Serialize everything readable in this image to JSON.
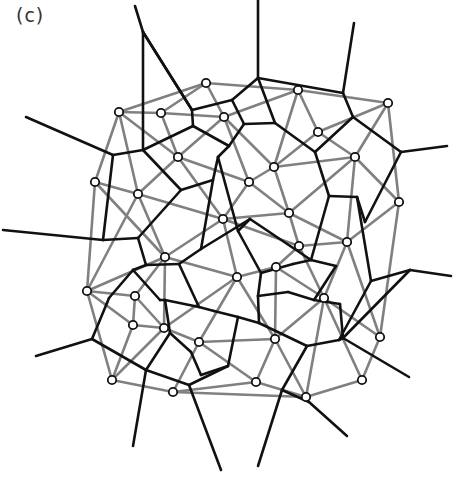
{
  "panel_label": "(c)",
  "colors": {
    "voronoi": "#111111",
    "delaunay": "#808080",
    "node_fill": "#ffffff",
    "node_stroke": "#111111"
  },
  "nodes": [
    [
      206,
      83
    ],
    [
      119,
      112
    ],
    [
      161,
      113
    ],
    [
      224,
      117
    ],
    [
      298,
      90
    ],
    [
      388,
      103
    ],
    [
      318,
      132
    ],
    [
      178,
      157
    ],
    [
      274,
      167
    ],
    [
      355,
      157
    ],
    [
      95,
      182
    ],
    [
      138,
      194
    ],
    [
      249,
      182
    ],
    [
      223,
      219
    ],
    [
      289,
      213
    ],
    [
      399,
      202
    ],
    [
      347,
      242
    ],
    [
      299,
      246
    ],
    [
      165,
      257
    ],
    [
      276,
      267
    ],
    [
      237,
      277
    ],
    [
      87,
      291
    ],
    [
      135,
      296
    ],
    [
      324,
      298
    ],
    [
      133,
      325
    ],
    [
      164,
      328
    ],
    [
      380,
      337
    ],
    [
      199,
      342
    ],
    [
      275,
      339
    ],
    [
      362,
      380
    ],
    [
      112,
      380
    ],
    [
      173,
      392
    ],
    [
      256,
      382
    ],
    [
      306,
      397
    ]
  ],
  "delaunay_edges": [
    [
      0,
      1
    ],
    [
      0,
      2
    ],
    [
      0,
      3
    ],
    [
      0,
      4
    ],
    [
      1,
      2
    ],
    [
      2,
      3
    ],
    [
      3,
      4
    ],
    [
      4,
      5
    ],
    [
      4,
      6
    ],
    [
      4,
      8
    ],
    [
      3,
      8
    ],
    [
      5,
      6
    ],
    [
      5,
      9
    ],
    [
      5,
      15
    ],
    [
      6,
      8
    ],
    [
      6,
      9
    ],
    [
      1,
      7
    ],
    [
      2,
      7
    ],
    [
      3,
      7
    ],
    [
      1,
      10
    ],
    [
      1,
      11
    ],
    [
      7,
      11
    ],
    [
      7,
      12
    ],
    [
      3,
      12
    ],
    [
      8,
      12
    ],
    [
      8,
      9
    ],
    [
      8,
      14
    ],
    [
      9,
      14
    ],
    [
      9,
      15
    ],
    [
      9,
      16
    ],
    [
      10,
      11
    ],
    [
      10,
      21
    ],
    [
      10,
      18
    ],
    [
      11,
      18
    ],
    [
      11,
      13
    ],
    [
      7,
      13
    ],
    [
      12,
      13
    ],
    [
      12,
      14
    ],
    [
      13,
      14
    ],
    [
      14,
      16
    ],
    [
      14,
      17
    ],
    [
      15,
      16
    ],
    [
      15,
      26
    ],
    [
      16,
      17
    ],
    [
      16,
      23
    ],
    [
      16,
      26
    ],
    [
      13,
      17
    ],
    [
      13,
      18
    ],
    [
      13,
      20
    ],
    [
      17,
      19
    ],
    [
      17,
      23
    ],
    [
      19,
      20
    ],
    [
      19,
      23
    ],
    [
      19,
      28
    ],
    [
      18,
      20
    ],
    [
      18,
      21
    ],
    [
      18,
      22
    ],
    [
      18,
      25
    ],
    [
      20,
      25
    ],
    [
      20,
      27
    ],
    [
      20,
      28
    ],
    [
      21,
      22
    ],
    [
      21,
      24
    ],
    [
      21,
      30
    ],
    [
      22,
      24
    ],
    [
      22,
      25
    ],
    [
      24,
      25
    ],
    [
      24,
      30
    ],
    [
      25,
      27
    ],
    [
      25,
      30
    ],
    [
      27,
      28
    ],
    [
      27,
      31
    ],
    [
      27,
      32
    ],
    [
      28,
      32
    ],
    [
      28,
      23
    ],
    [
      28,
      33
    ],
    [
      23,
      26
    ],
    [
      23,
      29
    ],
    [
      23,
      33
    ],
    [
      26,
      29
    ],
    [
      29,
      33
    ],
    [
      30,
      31
    ],
    [
      31,
      32
    ],
    [
      32,
      33
    ],
    [
      31,
      33
    ],
    [
      21,
      11
    ]
  ],
  "voronoi_vertices": [
    [
      143,
      32
    ],
    [
      143,
      150
    ],
    [
      113,
      155
    ],
    [
      192,
      110
    ],
    [
      193,
      126
    ],
    [
      258,
      78
    ],
    [
      232,
      100
    ],
    [
      229,
      146
    ],
    [
      244,
      124
    ],
    [
      275,
      123
    ],
    [
      343,
      93
    ],
    [
      353,
      117
    ],
    [
      401,
      152
    ],
    [
      218,
      157
    ],
    [
      213,
      180
    ],
    [
      181,
      190
    ],
    [
      138,
      238
    ],
    [
      103,
      240
    ],
    [
      109,
      298
    ],
    [
      133,
      270
    ],
    [
      146,
      265
    ],
    [
      165,
      300
    ],
    [
      179,
      264
    ],
    [
      250,
      219
    ],
    [
      238,
      231
    ],
    [
      201,
      249
    ],
    [
      315,
      152
    ],
    [
      329,
      196
    ],
    [
      357,
      197
    ],
    [
      365,
      222
    ],
    [
      261,
      273
    ],
    [
      258,
      296
    ],
    [
      293,
      264
    ],
    [
      311,
      260
    ],
    [
      336,
      266
    ],
    [
      288,
      292
    ],
    [
      314,
      300
    ],
    [
      371,
      281
    ],
    [
      410,
      270
    ],
    [
      343,
      338
    ],
    [
      339,
      340
    ],
    [
      307,
      346
    ],
    [
      238,
      317
    ],
    [
      259,
      323
    ],
    [
      214,
      311
    ],
    [
      199,
      307
    ],
    [
      170,
      333
    ],
    [
      146,
      370
    ],
    [
      92,
      339
    ],
    [
      107,
      303
    ],
    [
      228,
      366
    ],
    [
      189,
      385
    ],
    [
      201,
      375
    ],
    [
      309,
      402
    ],
    [
      282,
      390
    ],
    [
      160,
      300
    ],
    [
      191,
      352
    ],
    [
      340,
      304
    ]
  ],
  "voronoi_edges": [
    [
      0,
      1
    ],
    [
      1,
      2
    ],
    [
      0,
      3
    ],
    [
      3,
      4
    ],
    [
      1,
      4
    ],
    [
      4,
      7
    ],
    [
      3,
      6
    ],
    [
      6,
      5
    ],
    [
      6,
      8
    ],
    [
      8,
      7
    ],
    [
      8,
      9
    ],
    [
      9,
      5
    ],
    [
      9,
      26
    ],
    [
      5,
      10
    ],
    [
      10,
      11
    ],
    [
      11,
      26
    ],
    [
      11,
      12
    ],
    [
      12,
      29
    ],
    [
      29,
      28
    ],
    [
      28,
      27
    ],
    [
      27,
      26
    ],
    [
      27,
      33
    ],
    [
      28,
      37
    ],
    [
      37,
      38
    ],
    [
      37,
      40
    ],
    [
      40,
      39
    ],
    [
      39,
      38
    ],
    [
      7,
      13
    ],
    [
      13,
      14
    ],
    [
      14,
      15
    ],
    [
      15,
      1
    ],
    [
      15,
      16
    ],
    [
      16,
      17
    ],
    [
      16,
      20
    ],
    [
      17,
      2
    ],
    [
      20,
      19
    ],
    [
      19,
      18
    ],
    [
      18,
      49
    ],
    [
      49,
      48
    ],
    [
      20,
      22
    ],
    [
      22,
      25
    ],
    [
      25,
      14
    ],
    [
      25,
      23
    ],
    [
      23,
      24
    ],
    [
      24,
      13
    ],
    [
      23,
      33
    ],
    [
      33,
      34
    ],
    [
      34,
      36
    ],
    [
      36,
      35
    ],
    [
      35,
      31
    ],
    [
      31,
      30
    ],
    [
      30,
      32
    ],
    [
      32,
      33
    ],
    [
      30,
      24
    ],
    [
      31,
      43
    ],
    [
      43,
      42
    ],
    [
      42,
      44
    ],
    [
      44,
      45
    ],
    [
      45,
      21
    ],
    [
      21,
      55
    ],
    [
      55,
      19
    ],
    [
      45,
      22
    ],
    [
      21,
      46
    ],
    [
      46,
      47
    ],
    [
      47,
      48
    ],
    [
      46,
      56
    ],
    [
      56,
      52
    ],
    [
      52,
      50
    ],
    [
      50,
      42
    ],
    [
      43,
      41
    ],
    [
      41,
      40
    ],
    [
      41,
      54
    ],
    [
      54,
      53
    ],
    [
      36,
      57
    ],
    [
      57,
      39
    ],
    [
      50,
      51
    ],
    [
      51,
      47
    ]
  ],
  "voronoi_rays": [
    [
      0,
      [
        135,
        6
      ]
    ],
    [
      3,
      [
        143,
        32
      ]
    ],
    [
      2,
      [
        26,
        117
      ]
    ],
    [
      5,
      [
        258,
        0
      ]
    ],
    [
      10,
      [
        354,
        23
      ]
    ],
    [
      12,
      [
        447,
        146
      ]
    ],
    [
      17,
      [
        3,
        230
      ]
    ],
    [
      48,
      [
        36,
        356
      ]
    ],
    [
      38,
      [
        451,
        276
      ]
    ],
    [
      39,
      [
        409,
        377
      ]
    ],
    [
      47,
      [
        133,
        446
      ]
    ],
    [
      51,
      [
        221,
        470
      ]
    ],
    [
      54,
      [
        258,
        466
      ]
    ],
    [
      53,
      [
        347,
        436
      ]
    ]
  ]
}
